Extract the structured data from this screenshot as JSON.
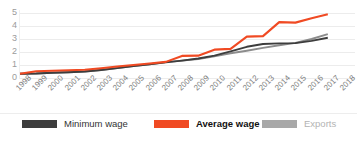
{
  "chart_data": {
    "type": "line",
    "title": "",
    "xlabel": "",
    "ylabel": "",
    "x": [
      "1998",
      "1999",
      "2000",
      "2001",
      "2002",
      "2003",
      "2004",
      "2005",
      "2006",
      "2007",
      "2008",
      "2009",
      "2010",
      "2011",
      "2012",
      "2013",
      "2014",
      "2015",
      "2016",
      "2017",
      "2018"
    ],
    "ylim": [
      0,
      5
    ],
    "yticks": [
      "0",
      "1",
      "2",
      "3",
      "4",
      "5"
    ],
    "grid": true,
    "legend_position": "bottom",
    "series": [
      {
        "name": "Minimum wage",
        "color": "#3d3d3d",
        "values": [
          0.33,
          0.35,
          0.4,
          0.44,
          0.5,
          0.62,
          0.76,
          0.92,
          1.06,
          1.2,
          1.34,
          1.5,
          1.72,
          2.05,
          2.4,
          2.62,
          2.66,
          2.68,
          2.86,
          3.1,
          null
        ]
      },
      {
        "name": "Average wage",
        "color": "#f04a23",
        "values": [
          0.33,
          0.52,
          0.56,
          0.6,
          0.64,
          0.75,
          0.88,
          1.0,
          1.12,
          1.24,
          1.7,
          1.72,
          2.18,
          2.24,
          3.18,
          3.22,
          4.3,
          4.26,
          4.6,
          4.9,
          null
        ]
      },
      {
        "name": "Exports",
        "color": "#8c8c8c",
        "values": [
          0.33,
          0.35,
          0.4,
          0.44,
          0.5,
          0.62,
          0.76,
          0.92,
          1.06,
          1.22,
          1.34,
          1.46,
          1.66,
          1.9,
          2.1,
          2.32,
          2.52,
          2.7,
          3.0,
          3.38,
          null
        ]
      }
    ]
  },
  "legend": {
    "items": [
      {
        "label": "Minimum wage",
        "color": "#3d3d3d",
        "style": "dark"
      },
      {
        "label": "Average wage",
        "color": "#f04a23",
        "style": "accent"
      },
      {
        "label": "Exports",
        "color": "#a8a8a8",
        "style": "muted"
      }
    ]
  },
  "colors": {
    "minimum_wage": "#3d3d3d",
    "average_wage": "#f04a23",
    "exports": "#8c8c8c",
    "gridline": "#ececec",
    "tick_text": "#9b9b9b",
    "xlabel_text": "#7d7d7d"
  }
}
